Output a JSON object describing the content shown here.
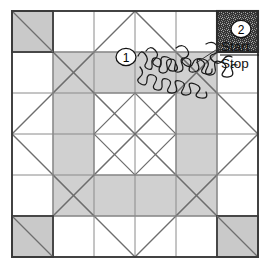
{
  "figure": {
    "background_color": "#ffffff",
    "canvas": {
      "width": 266,
      "height": 265
    }
  },
  "colors": {
    "gray_fill": "#d0d0d0",
    "corner_fill": "#c9c9c9",
    "outer_border": "#3a3a3a",
    "thin_line": "#8a8a8a",
    "diagonal_line": "#6e6e6e",
    "curve_stroke": "#1a1a1a",
    "text": "#111111",
    "marker_fill": "#ffffff",
    "dense_fill": "#4a4a4a"
  },
  "board": {
    "outer_square": {
      "x": 12,
      "y": 11,
      "width": 246,
      "height": 246
    },
    "grid_divisions": 3,
    "cell_size": 82,
    "grid_x": [
      12,
      53,
      94,
      135,
      176,
      217,
      258
    ],
    "grid_y": [
      11,
      52,
      93,
      134,
      175,
      216,
      257
    ]
  },
  "corner_squares": [
    {
      "name": "top-left",
      "x": 12,
      "y": 11,
      "size": 41,
      "diagonal": "tl-br"
    },
    {
      "name": "top-right",
      "x": 217,
      "y": 11,
      "size": 41,
      "diagonal": "tr-bl",
      "filled_pattern": true
    },
    {
      "name": "bottom-left",
      "x": 12,
      "y": 216,
      "size": 41,
      "diagonal": "tl-br"
    },
    {
      "name": "bottom-right",
      "x": 217,
      "y": 216,
      "size": 41,
      "diagonal": "tl-br"
    }
  ],
  "markers": [
    {
      "id": "marker-1",
      "label": "1",
      "cx": 126,
      "cy": 57,
      "rx": 10,
      "ry": 8.5
    },
    {
      "id": "marker-2",
      "label": "2",
      "cx": 241,
      "cy": 29,
      "rx": 10,
      "ry": 8.5
    }
  ],
  "annotations": {
    "start_label": "Start",
    "stop_label": "Stop",
    "start_x": 221,
    "start_y": 50,
    "stop_x": 221,
    "stop_y": 66,
    "divider": {
      "x1": 220,
      "y1": 54,
      "x2": 258,
      "y2": 54
    }
  },
  "curve": {
    "name": "meandering-space-filling-curve",
    "description": "Wiggly maze-like path from marker 1 to the top-right corner square",
    "stroke_width": 1.3
  },
  "icons": {
    "marker_oval": "oval-number-badge",
    "fraction_rule": "horizontal-rule"
  }
}
